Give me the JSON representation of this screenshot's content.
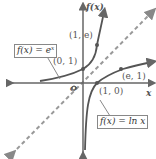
{
  "diagram": {
    "y_axis_label": "f(x)",
    "x_axis_label": "x",
    "origin_label": "O",
    "curves": [
      {
        "name": "exp",
        "label": "f(x) = e^x",
        "display": "f(x) = eˣ"
      },
      {
        "name": "ln",
        "label": "f(x) = ln x",
        "display": "f(x) = ln x"
      }
    ],
    "points": [
      {
        "label": "(1, e)"
      },
      {
        "label": "(0, 1)"
      },
      {
        "label": "(e, 1)"
      },
      {
        "label": "(1, 0)"
      }
    ],
    "mirror_line": "y = x (dashed)",
    "colors": {
      "curve": "#555555",
      "axis": "#666666",
      "dashed": "#888888"
    }
  }
}
